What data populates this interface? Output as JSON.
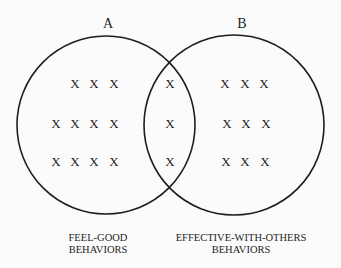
{
  "diagram": {
    "type": "venn",
    "colors": {
      "background": "#fbfbfb",
      "stroke": "#1e1e1e",
      "text": "#1e1e1e"
    },
    "sets": [
      {
        "id": "A",
        "label": "A",
        "caption_lines": [
          "FEEL-GOOD",
          "BEHAVIORS"
        ],
        "circle": {
          "cx": 106,
          "cy": 125,
          "r": 89
        },
        "label_pos": {
          "x": 108,
          "y": 28
        },
        "caption_pos": {
          "x": 98,
          "y1": 241,
          "y2": 253
        }
      },
      {
        "id": "B",
        "label": "B",
        "caption_lines": [
          "EFFECTIVE-WITH-OTHERS",
          "BEHAVIORS"
        ],
        "circle": {
          "cx": 234,
          "cy": 125,
          "r": 90
        },
        "label_pos": {
          "x": 242,
          "y": 28
        },
        "caption_pos": {
          "x": 241,
          "y1": 241,
          "y2": 253
        }
      }
    ],
    "marks": {
      "symbol": "X",
      "a_only": [
        {
          "x": 75,
          "y": 88
        },
        {
          "x": 94,
          "y": 88
        },
        {
          "x": 114,
          "y": 88
        },
        {
          "x": 56,
          "y": 128
        },
        {
          "x": 75,
          "y": 128
        },
        {
          "x": 94,
          "y": 128
        },
        {
          "x": 114,
          "y": 128
        },
        {
          "x": 56,
          "y": 166
        },
        {
          "x": 75,
          "y": 166
        },
        {
          "x": 94,
          "y": 166
        },
        {
          "x": 114,
          "y": 166
        }
      ],
      "intersection": [
        {
          "x": 170,
          "y": 88
        },
        {
          "x": 170,
          "y": 128
        },
        {
          "x": 170,
          "y": 166
        }
      ],
      "b_only": [
        {
          "x": 225,
          "y": 88
        },
        {
          "x": 245,
          "y": 88
        },
        {
          "x": 264,
          "y": 88
        },
        {
          "x": 227,
          "y": 128
        },
        {
          "x": 246,
          "y": 128
        },
        {
          "x": 266,
          "y": 128
        },
        {
          "x": 226,
          "y": 166
        },
        {
          "x": 245,
          "y": 166
        },
        {
          "x": 265,
          "y": 166
        }
      ],
      "counts": {
        "a_only": 11,
        "intersection": 3,
        "b_only": 9
      }
    }
  }
}
